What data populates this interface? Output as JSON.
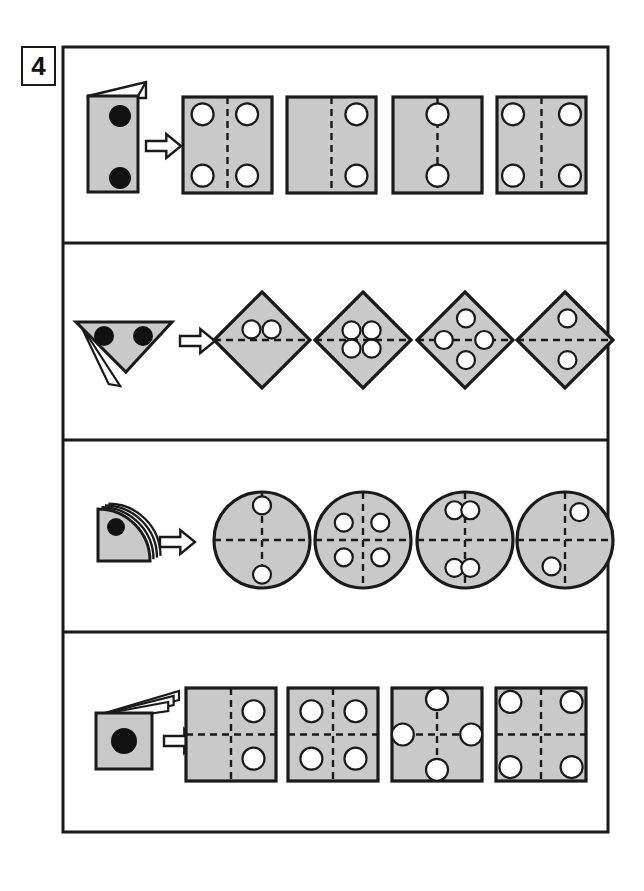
{
  "exercise": {
    "number_label": "4",
    "title_visible": false
  },
  "theme": {
    "page_background": "#ffffff",
    "frame_stroke": "#1a1a1a",
    "shape_fill": "#c9c9c9",
    "shape_stroke": "#1a1a1a",
    "hole_fill": "#ffffff",
    "punch_fill": "#111111",
    "dash_stroke": "#1a1a1a",
    "arrow_fill": "#ffffff",
    "arrow_stroke": "#1a1a1a"
  },
  "frame": {
    "x": 63,
    "y": 47,
    "width": 545,
    "height": 785,
    "row_dividers_y": [
      243,
      440,
      632
    ]
  },
  "number_box": {
    "x": 22,
    "y": 47,
    "width": 33,
    "height": 38
  },
  "rows": [
    {
      "id": "row-1",
      "name": "rectangle-fold-row",
      "folded": {
        "name": "folded-rectangle",
        "shape": "rectangle",
        "x": 88,
        "y": 96,
        "width": 50,
        "height": 96,
        "flap": "top-right-triangle",
        "punches": [
          {
            "cx": 120,
            "cy": 116,
            "r": 11
          },
          {
            "cx": 120,
            "cy": 178,
            "r": 11
          }
        ]
      },
      "arrow": {
        "name": "transform-arrow",
        "x": 146,
        "y": 134,
        "width": 35,
        "height": 24
      },
      "options": [
        {
          "id": "r1-o1",
          "name": "option-square",
          "x": 183,
          "y": 97,
          "width": 89,
          "height": 96,
          "fold_lines": [
            {
              "type": "vertical"
            }
          ],
          "holes": [
            {
              "cx": 0.22,
              "cy": 0.18,
              "r": 11
            },
            {
              "cx": 0.72,
              "cy": 0.18,
              "r": 11
            },
            {
              "cx": 0.22,
              "cy": 0.82,
              "r": 11
            },
            {
              "cx": 0.72,
              "cy": 0.82,
              "r": 11
            }
          ]
        },
        {
          "id": "r1-o2",
          "name": "option-square",
          "x": 287,
          "y": 97,
          "width": 89,
          "height": 96,
          "fold_lines": [
            {
              "type": "vertical"
            }
          ],
          "holes": [
            {
              "cx": 0.78,
              "cy": 0.18,
              "r": 11
            },
            {
              "cx": 0.78,
              "cy": 0.82,
              "r": 11
            }
          ]
        },
        {
          "id": "r1-o3",
          "name": "option-square",
          "x": 393,
          "y": 97,
          "width": 89,
          "height": 96,
          "fold_lines": [
            {
              "type": "vertical"
            }
          ],
          "holes": [
            {
              "cx": 0.5,
              "cy": 0.18,
              "r": 11
            },
            {
              "cx": 0.5,
              "cy": 0.82,
              "r": 11
            }
          ]
        },
        {
          "id": "r1-o4",
          "name": "option-square",
          "x": 497,
          "y": 97,
          "width": 89,
          "height": 96,
          "fold_lines": [
            {
              "type": "vertical"
            }
          ],
          "holes": [
            {
              "cx": 0.18,
              "cy": 0.18,
              "r": 11
            },
            {
              "cx": 0.82,
              "cy": 0.18,
              "r": 11
            },
            {
              "cx": 0.18,
              "cy": 0.82,
              "r": 11
            },
            {
              "cx": 0.82,
              "cy": 0.82,
              "r": 11
            }
          ]
        }
      ]
    },
    {
      "id": "row-2",
      "name": "triangle-fold-row",
      "folded": {
        "name": "folded-triangle",
        "shape": "triangle-down",
        "x": 76,
        "y": 322,
        "width": 96,
        "height": 50,
        "flap": "bottom-left-sliver",
        "punches": [
          {
            "cx": 104,
            "cy": 336,
            "r": 10
          },
          {
            "cx": 143,
            "cy": 336,
            "r": 10
          }
        ]
      },
      "arrow": {
        "name": "transform-arrow",
        "x": 180,
        "y": 329,
        "width": 35,
        "height": 24
      },
      "options": [
        {
          "id": "r2-o1",
          "name": "option-diamond",
          "cx": 262,
          "cy": 340,
          "r": 48,
          "fold_lines": [
            {
              "type": "horizontal"
            }
          ],
          "holes": [
            {
              "dx": -0.22,
              "dy": -0.22,
              "r": 9
            },
            {
              "dx": 0.2,
              "dy": -0.22,
              "r": 9
            }
          ]
        },
        {
          "id": "r2-o2",
          "name": "option-diamond",
          "cx": 363,
          "cy": 340,
          "r": 48,
          "fold_lines": [
            {
              "type": "horizontal"
            }
          ],
          "holes": [
            {
              "dx": -0.24,
              "dy": -0.2,
              "r": 9
            },
            {
              "dx": 0.18,
              "dy": -0.2,
              "r": 9
            },
            {
              "dx": -0.24,
              "dy": 0.18,
              "r": 9
            },
            {
              "dx": 0.18,
              "dy": 0.18,
              "r": 9
            }
          ]
        },
        {
          "id": "r2-o3",
          "name": "option-diamond",
          "cx": 465,
          "cy": 340,
          "r": 48,
          "fold_lines": [
            {
              "type": "horizontal"
            }
          ],
          "holes": [
            {
              "dx": 0.02,
              "dy": -0.45,
              "r": 9
            },
            {
              "dx": -0.44,
              "dy": 0.0,
              "r": 9
            },
            {
              "dx": 0.4,
              "dy": 0.0,
              "r": 9
            },
            {
              "dx": 0.02,
              "dy": 0.42,
              "r": 9
            }
          ]
        },
        {
          "id": "r2-o4",
          "name": "option-diamond",
          "cx": 565,
          "cy": 340,
          "r": 48,
          "fold_lines": [
            {
              "type": "horizontal"
            }
          ],
          "holes": [
            {
              "dx": 0.05,
              "dy": -0.45,
              "r": 9
            },
            {
              "dx": 0.05,
              "dy": 0.42,
              "r": 9
            }
          ]
        }
      ]
    },
    {
      "id": "row-3",
      "name": "quarter-circle-fold-row",
      "folded": {
        "name": "folded-quarter-circle",
        "shape": "quarter-circle",
        "x": 98,
        "y": 509,
        "width": 52,
        "height": 52,
        "flap": "stacked-arcs",
        "punches": [
          {
            "cx": 116,
            "cy": 527,
            "r": 9
          }
        ]
      },
      "arrow": {
        "name": "transform-arrow",
        "x": 160,
        "y": 530,
        "width": 35,
        "height": 24
      },
      "options": [
        {
          "id": "r3-o1",
          "name": "option-circle",
          "cx": 262,
          "cy": 540,
          "r": 48,
          "fold_lines": [
            {
              "type": "vertical"
            },
            {
              "type": "horizontal"
            }
          ],
          "holes": [
            {
              "dx": 0.0,
              "dy": -0.72,
              "r": 9
            },
            {
              "dx": 0.0,
              "dy": 0.72,
              "r": 9
            }
          ]
        },
        {
          "id": "r3-o2",
          "name": "option-circle",
          "cx": 363,
          "cy": 540,
          "r": 48,
          "fold_lines": [
            {
              "type": "vertical"
            },
            {
              "type": "horizontal"
            }
          ],
          "holes": [
            {
              "dx": -0.4,
              "dy": -0.36,
              "r": 9
            },
            {
              "dx": 0.36,
              "dy": -0.36,
              "r": 9
            },
            {
              "dx": -0.4,
              "dy": 0.36,
              "r": 9
            },
            {
              "dx": 0.36,
              "dy": 0.36,
              "r": 9
            }
          ]
        },
        {
          "id": "r3-o3",
          "name": "option-circle",
          "cx": 465,
          "cy": 540,
          "r": 48,
          "fold_lines": [
            {
              "type": "vertical"
            },
            {
              "type": "horizontal"
            }
          ],
          "holes": [
            {
              "dx": -0.22,
              "dy": -0.62,
              "r": 9
            },
            {
              "dx": 0.11,
              "dy": -0.62,
              "r": 9
            },
            {
              "dx": -0.22,
              "dy": 0.58,
              "r": 9
            },
            {
              "dx": 0.11,
              "dy": 0.58,
              "r": 9
            }
          ]
        },
        {
          "id": "r3-o4",
          "name": "option-circle",
          "cx": 565,
          "cy": 540,
          "r": 48,
          "fold_lines": [
            {
              "type": "vertical"
            },
            {
              "type": "horizontal"
            }
          ],
          "holes": [
            {
              "dx": 0.3,
              "dy": -0.58,
              "r": 9
            },
            {
              "dx": -0.28,
              "dy": 0.55,
              "r": 9
            }
          ]
        }
      ]
    },
    {
      "id": "row-4",
      "name": "square-fold-row",
      "folded": {
        "name": "folded-square",
        "shape": "square",
        "x": 96,
        "y": 713,
        "width": 56,
        "height": 56,
        "flap": "fanned-flaps",
        "punches": [
          {
            "cx": 124,
            "cy": 741,
            "r": 13
          }
        ]
      },
      "arrow": {
        "name": "transform-arrow",
        "x": 164,
        "y": 729,
        "width": 35,
        "height": 24
      },
      "options": [
        {
          "id": "r4-o1",
          "name": "option-square",
          "x": 186,
          "y": 688,
          "width": 90,
          "height": 93,
          "fold_lines": [
            {
              "type": "vertical"
            },
            {
              "type": "horizontal"
            }
          ],
          "holes": [
            {
              "cx": 0.75,
              "cy": 0.25,
              "r": 11
            },
            {
              "cx": 0.75,
              "cy": 0.76,
              "r": 11
            }
          ]
        },
        {
          "id": "r4-o2",
          "name": "option-square",
          "x": 288,
          "y": 688,
          "width": 90,
          "height": 93,
          "fold_lines": [
            {
              "type": "vertical"
            },
            {
              "type": "horizontal"
            }
          ],
          "holes": [
            {
              "cx": 0.26,
              "cy": 0.25,
              "r": 11
            },
            {
              "cx": 0.75,
              "cy": 0.25,
              "r": 11
            },
            {
              "cx": 0.26,
              "cy": 0.76,
              "r": 11
            },
            {
              "cx": 0.75,
              "cy": 0.76,
              "r": 11
            }
          ]
        },
        {
          "id": "r4-o3",
          "name": "option-square",
          "x": 392,
          "y": 688,
          "width": 90,
          "height": 93,
          "fold_lines": [
            {
              "type": "vertical"
            },
            {
              "type": "horizontal"
            }
          ],
          "holes": [
            {
              "cx": 0.5,
              "cy": 0.12,
              "r": 11
            },
            {
              "cx": 0.12,
              "cy": 0.5,
              "r": 11
            },
            {
              "cx": 0.88,
              "cy": 0.5,
              "r": 11
            },
            {
              "cx": 0.5,
              "cy": 0.88,
              "r": 11
            }
          ]
        },
        {
          "id": "r4-o4",
          "name": "option-square",
          "x": 496,
          "y": 688,
          "width": 90,
          "height": 93,
          "fold_lines": [
            {
              "type": "vertical"
            },
            {
              "type": "horizontal"
            }
          ],
          "holes": [
            {
              "cx": 0.16,
              "cy": 0.15,
              "r": 11
            },
            {
              "cx": 0.84,
              "cy": 0.15,
              "r": 11
            },
            {
              "cx": 0.16,
              "cy": 0.85,
              "r": 11
            },
            {
              "cx": 0.84,
              "cy": 0.85,
              "r": 11
            }
          ]
        }
      ]
    }
  ]
}
